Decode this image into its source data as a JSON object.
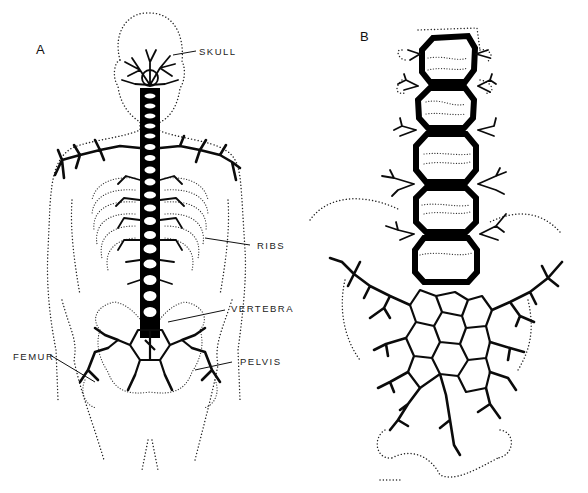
{
  "figure": {
    "panels": [
      {
        "id": "A",
        "letter": "A",
        "labels": {
          "skull": "SKULL",
          "ribs": "RIBS",
          "vertebra": "VERTEBRA",
          "femur": "FEMUR",
          "pelvis": "PELVIS"
        }
      },
      {
        "id": "B",
        "letter": "B"
      }
    ],
    "colors": {
      "background": "#ffffff",
      "ink": "#000000"
    }
  }
}
